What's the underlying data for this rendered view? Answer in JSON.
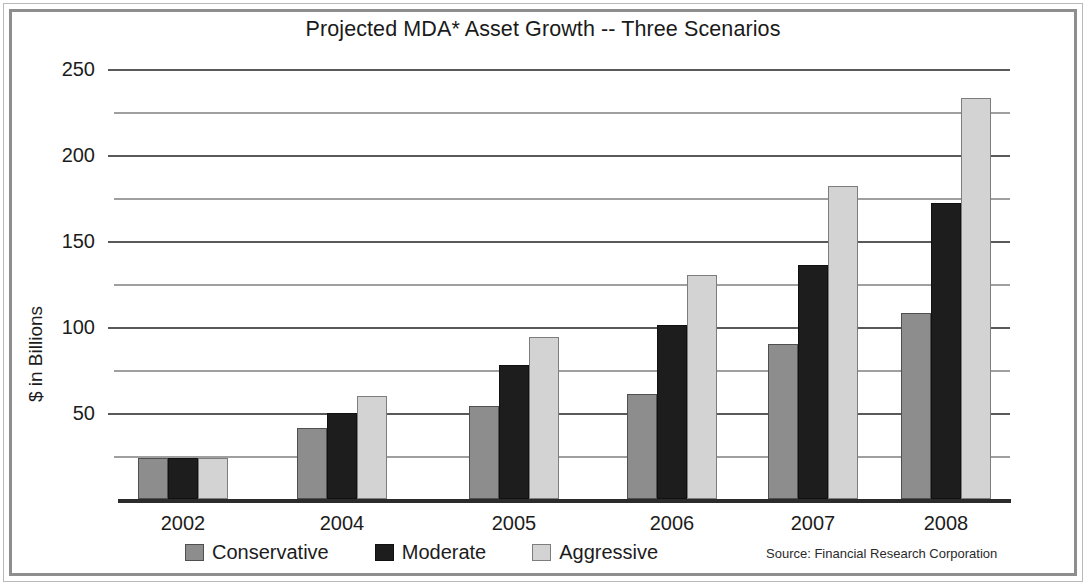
{
  "frame": {
    "border_color": "#8e8e8e",
    "background": "#ffffff"
  },
  "chart_data": {
    "type": "bar",
    "title": "Projected MDA* Asset Growth -- Three Scenarios",
    "xlabel": "",
    "ylabel": "$ in Billions",
    "categories": [
      "2002",
      "2004",
      "2005",
      "2006",
      "2007",
      "2008"
    ],
    "series": [
      {
        "name": "Conservative",
        "color": "#8d8d8d",
        "values": [
          24,
          41,
          54,
          61,
          90,
          108
        ]
      },
      {
        "name": "Moderate",
        "color": "#1d1d1d",
        "values": [
          24,
          50,
          78,
          101,
          136,
          172
        ]
      },
      {
        "name": "Aggressive",
        "color": "#d3d3d3",
        "values": [
          24,
          60,
          94,
          130,
          182,
          233
        ]
      }
    ],
    "ylim": [
      0,
      250
    ],
    "major_ticks": [
      50,
      100,
      150,
      200,
      250
    ],
    "minor_ticks": [
      25,
      75,
      125,
      175,
      225
    ],
    "ytick_labels": [
      "250",
      "200",
      "150",
      "100",
      "50"
    ],
    "grid": true,
    "legend_position": "bottom",
    "annotations": [
      "Source: Financial Research Corporation"
    ]
  },
  "legend": {
    "items": [
      {
        "label": "Conservative",
        "swatch": "conservative"
      },
      {
        "label": "Moderate",
        "swatch": "moderate"
      },
      {
        "label": "Aggressive",
        "swatch": "aggressive"
      }
    ]
  },
  "source": {
    "text": "Source: Financial Research Corporation"
  }
}
